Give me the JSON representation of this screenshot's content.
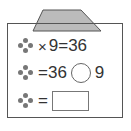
{
  "row1": {
    "op": "×",
    "text": "9=36"
  },
  "row2": {
    "text": "=36",
    "after": "9"
  },
  "row3": {
    "text": "="
  },
  "colors": {
    "lid": "#bbbbbb",
    "stroke": "#555555",
    "flower": "#777777"
  }
}
